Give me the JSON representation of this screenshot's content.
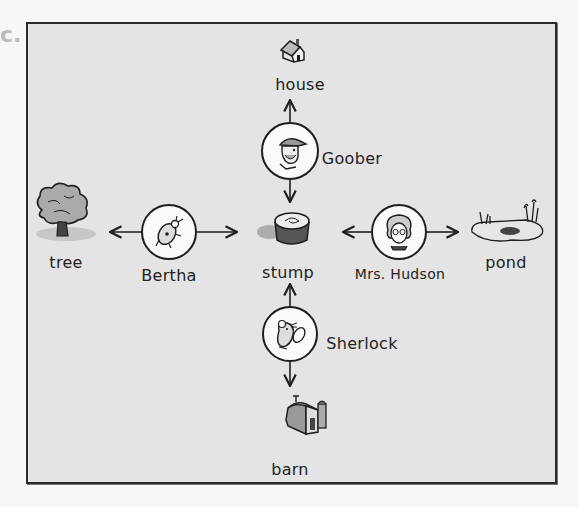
{
  "diagram": {
    "title_fragment": "c.",
    "places": {
      "house": {
        "label": "house",
        "icon": "house-icon"
      },
      "tree": {
        "label": "tree",
        "icon": "tree-icon"
      },
      "stump": {
        "label": "stump",
        "icon": "stump-icon"
      },
      "pond": {
        "label": "pond",
        "icon": "pond-icon"
      },
      "barn": {
        "label": "barn",
        "icon": "barn-icon"
      }
    },
    "characters": {
      "goober": {
        "label": "Goober",
        "icon": "farmer-portrait-icon",
        "arrows_to": [
          "house",
          "stump"
        ]
      },
      "bertha": {
        "label": "Bertha",
        "icon": "ladybug-portrait-icon",
        "arrows_to": [
          "tree",
          "stump"
        ]
      },
      "hudson": {
        "label": "Mrs. Hudson",
        "icon": "woman-portrait-icon",
        "arrows_to": [
          "stump",
          "pond"
        ]
      },
      "sherlock": {
        "label": "Sherlock",
        "icon": "mouse-portrait-icon",
        "arrows_to": [
          "stump",
          "barn"
        ]
      }
    },
    "colors": {
      "frame_border": "#2a2a2a",
      "frame_fill": "#e4e4e4",
      "ink": "#1e1e1e"
    }
  }
}
